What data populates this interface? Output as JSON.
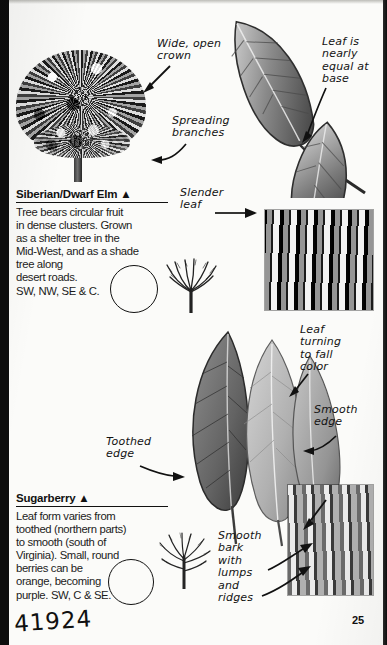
{
  "page": {
    "number": "25",
    "handwritten_scribble": "41924"
  },
  "entries": [
    {
      "title": "Siberian/Dwarf Elm ▲",
      "body": "Tree bears circular fruit\nin dense clusters. Grown\nas a shelter tree in the\nMid-West, and as a shade\ntree along\ndesert roads.\nSW, NW, SE & C."
    },
    {
      "title": "Sugarberry ▲",
      "body": "Leaf form varies from\ntoothed (northern parts)\nto smooth (south of\nVirginia). Small, round\nberries can be\norange, becoming\npurple. SW, C & SE."
    }
  ],
  "annotations": [
    {
      "id": "wide-open-crown",
      "text": "Wide, open\ncrown"
    },
    {
      "id": "spreading-branches",
      "text": "Spreading\nbranches"
    },
    {
      "id": "leaf-equal-at-base",
      "text": "Leaf is\nnearly\nequal at\nbase"
    },
    {
      "id": "slender-leaf",
      "text": "Slender\nleaf"
    },
    {
      "id": "leaf-fall-color",
      "text": "Leaf\nturning\nto fall\ncolor"
    },
    {
      "id": "smooth-edge",
      "text": "Smooth\nedge"
    },
    {
      "id": "toothed-edge",
      "text": "Toothed\nedge"
    },
    {
      "id": "smooth-bark",
      "text": "Smooth\nbark\nwith\nlumps\nand\nridges"
    }
  ],
  "figures": {
    "elm_crown_photo": "tree-crown-photo",
    "elm_leaves_photo": "elm-leaves-photo",
    "elm_bark_photo": "elm-bark-photo",
    "elm_winter_silhouette": "elm-winter-silhouette",
    "sugarberry_leaves_photo": "sugarberry-leaves-photo",
    "sugarberry_bark_photo": "sugarberry-bark-photo",
    "sugarberry_winter_silhouette": "sugarberry-winter-silhouette"
  },
  "colors": {
    "ink": "#111111",
    "paper": "#fbfbf9",
    "edge": "#0d0d0d"
  }
}
